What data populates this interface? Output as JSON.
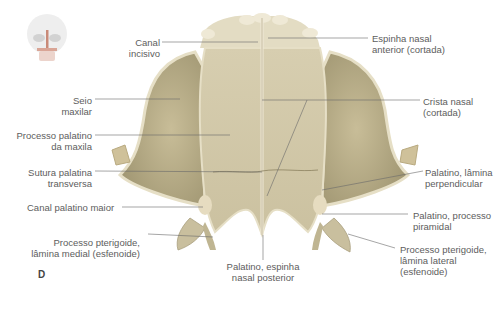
{
  "figure": {
    "panel_label": "D",
    "thumbnail": "skull-orientation-icon",
    "colors": {
      "bone": "#cdc3a2",
      "bone_shadow": "#a79d7b",
      "bone_light": "#e6dfc6",
      "highlight_cut": "#c98a78",
      "leader_line": "#6a6a6a",
      "label_text": "#5d5d5d"
    },
    "labels": {
      "canal_incisivo": [
        "Canal",
        "incisivo"
      ],
      "seio_maxilar": [
        "Seio",
        "maxilar"
      ],
      "processo_palatino": [
        "Processo palatino",
        "da maxila"
      ],
      "sutura_palatina": [
        "Sutura palatina",
        "transversa"
      ],
      "canal_palatino_maior": [
        "Canal palatino maior"
      ],
      "pterigoide_medial": [
        "Processo pterigoide,",
        "lâmina medial (esfenoide)"
      ],
      "espinha_posterior": [
        "Palatino, espinha",
        "nasal posterior"
      ],
      "espinha_anterior": [
        "Espinha nasal",
        "anterior (cortada)"
      ],
      "crista_nasal": [
        "Crista nasal",
        "(cortada)"
      ],
      "lamina_perpendicular": [
        "Palatino, lâmina",
        "perpendicular"
      ],
      "processo_piramidal": [
        "Palatino, processo",
        "piramidal"
      ],
      "pterigoide_lateral": [
        "Processo pterigoide,",
        "lâmina lateral",
        "(esfenoide)"
      ]
    }
  }
}
